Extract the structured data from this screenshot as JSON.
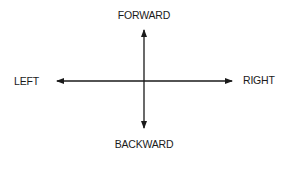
{
  "diagram": {
    "type": "direction-axes",
    "labels": {
      "up": "FORWARD",
      "down": "BACKWARD",
      "left": "LEFT",
      "right": "RIGHT"
    },
    "colors": {
      "arrow": "#1a1a1a",
      "text": "#1a1a1a",
      "background": "#ffffff"
    }
  }
}
